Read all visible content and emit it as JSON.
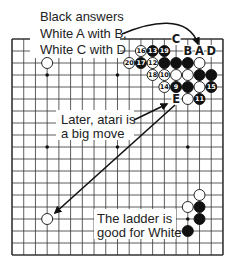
{
  "board": {
    "size": 19,
    "hoshi": [
      [
        3,
        3
      ],
      [
        9,
        3
      ],
      [
        15,
        3
      ],
      [
        3,
        9
      ],
      [
        9,
        9
      ],
      [
        15,
        9
      ],
      [
        3,
        15
      ],
      [
        9,
        15
      ],
      [
        15,
        15
      ]
    ],
    "line_color": "#333333",
    "stones": [
      {
        "col": 3,
        "row": 2,
        "color": "white",
        "label": ""
      },
      {
        "col": 11,
        "row": 1,
        "color": "white",
        "label": "16"
      },
      {
        "col": 12,
        "row": 1,
        "color": "black",
        "label": "13"
      },
      {
        "col": 13,
        "row": 1,
        "color": "black",
        "label": "19"
      },
      {
        "col": 10,
        "row": 2,
        "color": "white",
        "label": "20"
      },
      {
        "col": 11,
        "row": 2,
        "color": "black",
        "label": "17"
      },
      {
        "col": 12,
        "row": 2,
        "color": "white",
        "label": "12"
      },
      {
        "col": 13,
        "row": 2,
        "color": "black",
        "label": ""
      },
      {
        "col": 14,
        "row": 2,
        "color": "black",
        "label": ""
      },
      {
        "col": 15,
        "row": 2,
        "color": "black",
        "label": ""
      },
      {
        "col": 16,
        "row": 2,
        "color": "white",
        "label": ""
      },
      {
        "col": 12,
        "row": 3,
        "color": "white",
        "label": "18"
      },
      {
        "col": 13,
        "row": 3,
        "color": "white",
        "label": "10"
      },
      {
        "col": 14,
        "row": 3,
        "color": "white",
        "label": ""
      },
      {
        "col": 15,
        "row": 3,
        "color": "white",
        "label": ""
      },
      {
        "col": 16,
        "row": 3,
        "color": "black",
        "label": ""
      },
      {
        "col": 17,
        "row": 3,
        "color": "black",
        "label": ""
      },
      {
        "col": 13,
        "row": 4,
        "color": "white",
        "label": "14"
      },
      {
        "col": 14,
        "row": 4,
        "color": "black",
        "label": "9"
      },
      {
        "col": 15,
        "row": 4,
        "color": "black",
        "label": ""
      },
      {
        "col": 16,
        "row": 4,
        "color": "white",
        "label": ""
      },
      {
        "col": 17,
        "row": 4,
        "color": "black",
        "label": "15"
      },
      {
        "col": 15,
        "row": 5,
        "color": "white",
        "label": ""
      },
      {
        "col": 16,
        "row": 5,
        "color": "black",
        "label": "11"
      },
      {
        "col": 16,
        "row": 13,
        "color": "white",
        "label": ""
      },
      {
        "col": 15,
        "row": 14,
        "color": "white",
        "label": ""
      },
      {
        "col": 16,
        "row": 14,
        "color": "black",
        "label": ""
      },
      {
        "col": 16,
        "row": 15,
        "color": "black",
        "label": ""
      },
      {
        "col": 15,
        "row": 16,
        "color": "black",
        "label": ""
      },
      {
        "col": 3,
        "row": 15,
        "color": "white",
        "label": ""
      }
    ],
    "letters": [
      {
        "col": 14,
        "row": 0,
        "text": "C"
      },
      {
        "col": 15,
        "row": 1,
        "text": "B"
      },
      {
        "col": 16,
        "row": 1,
        "text": "A"
      },
      {
        "col": 17,
        "row": 1,
        "text": "D"
      },
      {
        "col": 14,
        "row": 5,
        "text": "E"
      }
    ]
  },
  "annotations": {
    "top": [
      "Black answers",
      "White A with B,",
      "White C with D"
    ],
    "middle": [
      "Later, atari is",
      "a big move"
    ],
    "bottom": [
      "The ladder is",
      "good for White"
    ]
  }
}
